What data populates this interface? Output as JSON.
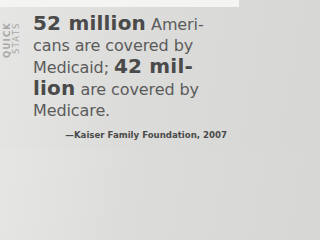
{
  "side_label": {
    "line1": "QUICK",
    "line2": "STATS"
  },
  "stat": {
    "line1_big": "52 million",
    "line1_rest": " Ameri-",
    "line2": "cans are covered by",
    "line3_rest": "Medicaid; ",
    "line3_big": "42 mil-",
    "line4_big": "lion",
    "line4_rest": " are covered by",
    "line5": "Medicare."
  },
  "source": "—Kaiser Family Foundation, 2007",
  "colors": {
    "background": "#dcdcda",
    "text": "#5b5b5b",
    "emphasis": "#4a4a4a",
    "side_label": "#a8a8a6"
  }
}
